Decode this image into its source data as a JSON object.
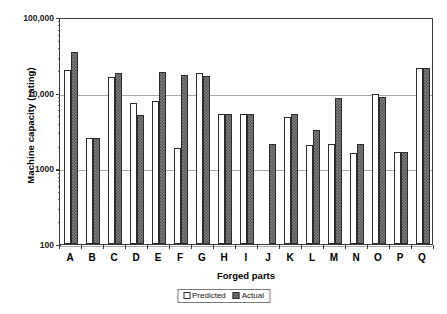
{
  "chart_data": {
    "type": "bar",
    "title": "",
    "xlabel": "Forged parts",
    "ylabel": "Machine capacity (rating)",
    "yscale": "log",
    "ylim": [
      100,
      100000
    ],
    "ytick_labels": [
      "100,000",
      "10,000",
      "1000",
      "100"
    ],
    "ytick_values": [
      100000,
      10000,
      1000,
      100
    ],
    "grid": true,
    "grid_axis": "y",
    "legend_position": "bottom-center",
    "categories": [
      "A",
      "B",
      "C",
      "D",
      "E",
      "F",
      "G",
      "H",
      "I",
      "J",
      "K",
      "L",
      "M",
      "N",
      "O",
      "P",
      "Q"
    ],
    "series": [
      {
        "name": "Predicted",
        "color": "#ffffff",
        "values": [
          20000,
          2500,
          16000,
          7200,
          7800,
          1850,
          18000,
          5200,
          5200,
          0,
          4800,
          2050,
          2100,
          1600,
          9600,
          1650,
          21000
        ]
      },
      {
        "name": "Actual",
        "color": "#808080",
        "values": [
          35000,
          2500,
          18000,
          5100,
          18500,
          17000,
          16500,
          5200,
          5200,
          2100,
          5300,
          3200,
          8600,
          2100,
          8700,
          1650,
          21000
        ]
      }
    ]
  },
  "axes": {
    "y_title": "Machine capacity (rating)",
    "x_title": "Forged parts",
    "y_ticks": [
      {
        "label": "100,000",
        "value": 100000
      },
      {
        "label": "10,000",
        "value": 10000
      },
      {
        "label": "1000",
        "value": 1000
      },
      {
        "label": "100",
        "value": 100
      }
    ],
    "x_ticks": [
      "A",
      "B",
      "C",
      "D",
      "E",
      "F",
      "G",
      "H",
      "I",
      "J",
      "K",
      "L",
      "M",
      "N",
      "O",
      "P",
      "Q"
    ]
  },
  "legend": {
    "items": [
      {
        "label": "Predicted",
        "swatch": "predicted"
      },
      {
        "label": "Actual",
        "swatch": "actual"
      }
    ]
  }
}
